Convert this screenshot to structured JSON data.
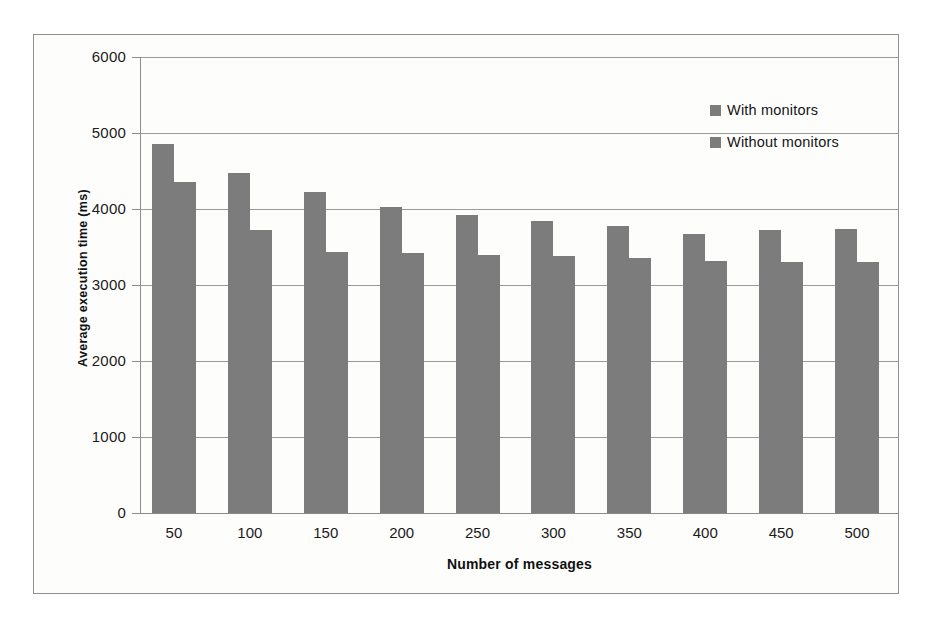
{
  "chart_data": {
    "type": "bar",
    "title": "",
    "subtitle": "",
    "xlabel": "Number of messages",
    "ylabel": "Average execution time (ms)",
    "categories": [
      "50",
      "100",
      "150",
      "200",
      "250",
      "300",
      "350",
      "400",
      "450",
      "500"
    ],
    "series": [
      {
        "name": "With monitors",
        "values": [
          4850,
          4470,
          4230,
          4030,
          3920,
          3840,
          3780,
          3670,
          3730,
          3740
        ]
      },
      {
        "name": "Without monitors",
        "values": [
          4360,
          3720,
          3440,
          3420,
          3400,
          3380,
          3350,
          3320,
          3300,
          3300
        ]
      }
    ],
    "ylim": [
      0,
      6000
    ],
    "ytick_labels": [
      "6000",
      "5000",
      "4000",
      "3000",
      "2000",
      "1000",
      "0"
    ],
    "ytick_values": [
      6000,
      5000,
      4000,
      3000,
      2000,
      1000,
      0
    ],
    "grid": "horizontal",
    "legend_position": "top-right",
    "bar_color": "#7c7c7c",
    "grid_color": "#9a9a9a",
    "axis_color": "#8d8d8d",
    "background_color": "#fdfdfc"
  }
}
